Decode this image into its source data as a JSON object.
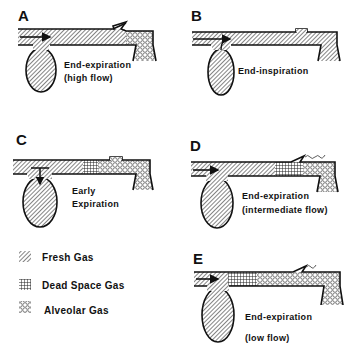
{
  "figure": {
    "panels": [
      {
        "letter": "A",
        "caption_line1": "End-expiration",
        "caption_line2": "(high flow)"
      },
      {
        "letter": "B",
        "caption_line1": "End-inspiration",
        "caption_line2": ""
      },
      {
        "letter": "C",
        "caption_line1": "Early",
        "caption_line2": "Expiration"
      },
      {
        "letter": "D",
        "caption_line1": "End-expiration",
        "caption_line2": "(intermediate flow)"
      },
      {
        "letter": "E",
        "caption_line1": "End-expiration",
        "caption_line2": "(low flow)"
      }
    ],
    "legend": {
      "items": [
        {
          "pattern": "diagonal-hatch",
          "label": "Fresh Gas"
        },
        {
          "pattern": "cross-hatch",
          "label": "Dead Space Gas"
        },
        {
          "pattern": "circles",
          "label": "Alveolar Gas"
        }
      ]
    },
    "colors": {
      "ink": "#111111",
      "background": "#ffffff"
    }
  }
}
